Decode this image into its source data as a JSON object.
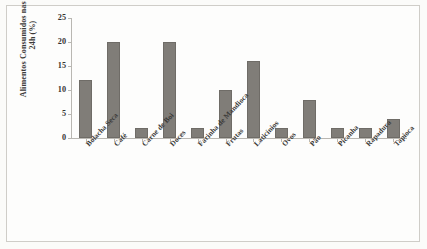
{
  "chart_data": {
    "type": "bar",
    "title": "",
    "xlabel": "",
    "ylabel": "Alimentos Consumidos nas últimas 24h (%)",
    "ylabel_lines": [
      "Alimentos Consumidos nas últimas",
      "24h (%)"
    ],
    "categories": [
      "Bolacha Seca",
      "Café",
      "Carne de Boi",
      "Doces",
      "Farinha de Mandioca",
      "Frutas",
      "Laticínios",
      "Ovos",
      "Pão",
      "Picanha",
      "Rapadura",
      "Tapioca"
    ],
    "values": [
      12,
      20,
      2,
      20,
      2,
      10,
      16,
      2,
      8,
      2,
      2,
      4
    ],
    "ylim": [
      0,
      25
    ],
    "yticks": [
      0,
      5,
      10,
      15,
      20,
      25
    ],
    "ytick_labels": [
      "0",
      "5",
      "10",
      "15",
      "20",
      "25"
    ],
    "grid": false,
    "legend": false,
    "bar_color": "#807d78",
    "axis_color": "#b9b7b2",
    "background_color": "#fdfdfc"
  }
}
